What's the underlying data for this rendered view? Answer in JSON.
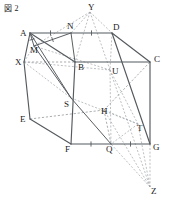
{
  "figure": {
    "caption": "図 2",
    "type": "geometry-diagram",
    "width": 172,
    "height": 213,
    "colors": {
      "background": "#ffffff",
      "solid_edge": "#555a5e",
      "hidden_edge": "#8d9296",
      "label_text": "#1b1b1b"
    }
  },
  "vertices": [
    {
      "name": "A",
      "x": 30,
      "y": 33,
      "lx": 20,
      "ly": 36,
      "kind": "cube"
    },
    {
      "name": "N",
      "x": 71,
      "y": 33,
      "lx": 67,
      "ly": 29,
      "kind": "midpoint"
    },
    {
      "name": "D",
      "x": 112,
      "y": 33,
      "lx": 113,
      "ly": 30,
      "kind": "cube"
    },
    {
      "name": "C",
      "x": 150,
      "y": 62,
      "lx": 154,
      "ly": 62,
      "kind": "cube"
    },
    {
      "name": "B",
      "x": 75,
      "y": 62,
      "lx": 78,
      "ly": 70,
      "kind": "cube"
    },
    {
      "name": "X",
      "x": 24,
      "y": 62,
      "lx": 15,
      "ly": 65,
      "kind": "external"
    },
    {
      "name": "M",
      "x": 34,
      "y": 46,
      "lx": 30,
      "ly": 53,
      "kind": "midpoint"
    },
    {
      "name": "Y",
      "x": 90,
      "y": 12,
      "lx": 88,
      "ly": 10,
      "kind": "external"
    },
    {
      "name": "U",
      "x": 110,
      "y": 70,
      "lx": 112,
      "ly": 74,
      "kind": "intersection"
    },
    {
      "name": "S",
      "x": 71,
      "y": 98,
      "lx": 64,
      "ly": 107,
      "kind": "intersection"
    },
    {
      "name": "H",
      "x": 104,
      "y": 110,
      "lx": 101,
      "ly": 114,
      "kind": "cube"
    },
    {
      "name": "T",
      "x": 138,
      "y": 124,
      "lx": 137,
      "ly": 131,
      "kind": "intersection"
    },
    {
      "name": "E",
      "x": 30,
      "y": 119,
      "lx": 20,
      "ly": 122,
      "kind": "cube"
    },
    {
      "name": "F",
      "x": 71,
      "y": 144,
      "lx": 65,
      "ly": 152,
      "kind": "cube"
    },
    {
      "name": "Q",
      "x": 111,
      "y": 144,
      "lx": 106,
      "ly": 152,
      "kind": "midpoint"
    },
    {
      "name": "G",
      "x": 150,
      "y": 144,
      "lx": 153,
      "ly": 150,
      "kind": "cube"
    },
    {
      "name": "Z",
      "x": 150,
      "y": 187,
      "lx": 151,
      "ly": 194,
      "kind": "external"
    }
  ],
  "solid_edges": [
    [
      "A",
      "N"
    ],
    [
      "N",
      "D"
    ],
    [
      "D",
      "C"
    ],
    [
      "A",
      "X"
    ],
    [
      "X",
      "E"
    ],
    [
      "E",
      "F"
    ],
    [
      "F",
      "Q"
    ],
    [
      "Q",
      "G"
    ],
    [
      "G",
      "C"
    ],
    [
      "B",
      "C"
    ],
    [
      "B",
      "F"
    ],
    [
      "A",
      "B"
    ],
    [
      "D",
      "G"
    ]
  ],
  "hidden_edges": [
    [
      "X",
      "B"
    ],
    [
      "E",
      "H"
    ],
    [
      "H",
      "C"
    ],
    [
      "H",
      "Q"
    ]
  ],
  "aux_solid_lines": [
    [
      "A",
      "M"
    ],
    [
      "M",
      "N"
    ],
    [
      "M",
      "S"
    ],
    [
      "A",
      "S"
    ],
    [
      "S",
      "Q"
    ],
    [
      "N",
      "B"
    ]
  ],
  "aux_dashed_lines": [
    [
      "Y",
      "N"
    ],
    [
      "Y",
      "D"
    ],
    [
      "Y",
      "M"
    ],
    [
      "Y",
      "U"
    ],
    [
      "Y",
      "B"
    ],
    [
      "X",
      "S"
    ],
    [
      "X",
      "M"
    ],
    [
      "X",
      "U"
    ],
    [
      "Z",
      "T"
    ],
    [
      "Z",
      "G"
    ],
    [
      "Z",
      "Q"
    ],
    [
      "Z",
      "U"
    ],
    [
      "Z",
      "H"
    ],
    [
      "U",
      "Q"
    ],
    [
      "U",
      "T"
    ],
    [
      "T",
      "Q"
    ],
    [
      "T",
      "H"
    ],
    [
      "D",
      "U"
    ],
    [
      "M",
      "U"
    ],
    [
      "S",
      "T"
    ]
  ],
  "tick_marks": [
    {
      "on": "A-N",
      "count": 1
    },
    {
      "on": "N-D",
      "count": 1
    },
    {
      "on": "A-M",
      "count": 1
    },
    {
      "on": "M-N",
      "count": 1
    },
    {
      "on": "F-Q",
      "count": 1
    },
    {
      "on": "Q-G",
      "count": 1
    }
  ]
}
